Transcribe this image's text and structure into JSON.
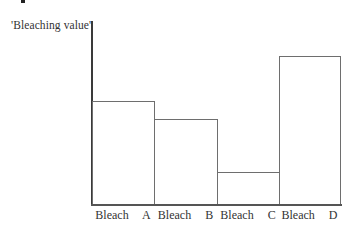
{
  "chart_data": {
    "type": "bar",
    "title": "",
    "xlabel": "",
    "ylabel": "Bleaching value",
    "categories": [
      "Bleach A",
      "Bleach B",
      "Bleach C",
      "Bleach D"
    ],
    "values": [
      104,
      86,
      33,
      149
    ],
    "value_units": "relative (no scale shown; pixel heights above baseline)",
    "ylim": [
      0,
      184
    ],
    "grid": false,
    "legend": null,
    "bar_style": {
      "fill": "#ffffff",
      "edge": "#6e6e6e"
    }
  },
  "labels": {
    "ylabel": "'Bleaching value'",
    "x": [
      "Bleach  A",
      "Bleach  B",
      "Bleach  C",
      "Bleach  D"
    ]
  }
}
